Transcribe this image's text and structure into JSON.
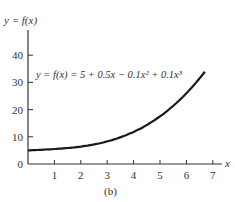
{
  "chart_data": {
    "type": "line",
    "title": "",
    "caption": "(b)",
    "ylabel": "y = f(x)",
    "xlabel": "x",
    "annotation": "y = f(x) = 5 + 0.5x − 0.1x² + 0.1x³",
    "function": {
      "c0": 5,
      "c1": 0.5,
      "c2": -0.1,
      "c3": 0.1
    },
    "x_range": [
      0,
      6.7
    ],
    "xlim": [
      0,
      7.5
    ],
    "ylim": [
      0,
      45
    ],
    "x_ticks": [
      1,
      2,
      3,
      4,
      5,
      6,
      7
    ],
    "y_ticks": [
      0,
      10,
      20,
      30,
      40
    ],
    "x": [
      0,
      1,
      2,
      3,
      4,
      5,
      6,
      6.7
    ],
    "values": [
      5,
      5.5,
      6.4,
      8.1,
      10.8,
      15,
      21.2,
      32.7
    ],
    "grid": false,
    "legend": "none"
  }
}
